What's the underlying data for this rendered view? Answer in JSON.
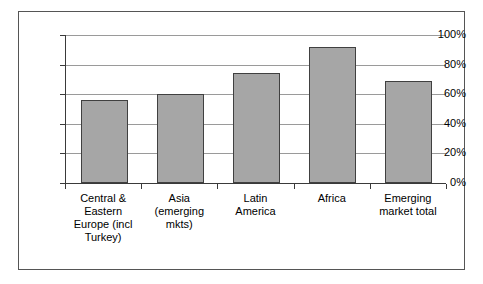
{
  "chart_data": {
    "type": "bar",
    "title": "",
    "subtitle": "",
    "xlabel": "",
    "ylabel": "",
    "categories": [
      "Central & Eastern Europe (incl Turkey)",
      "Asia (emerging mkts)",
      "Latin America",
      "Africa",
      "Emerging market total"
    ],
    "values": [
      56,
      60,
      74,
      92,
      69
    ],
    "value_unit": "%",
    "ylim": [
      0,
      100
    ],
    "ytick_labels": [
      "0%",
      "20%",
      "40%",
      "60%",
      "80%",
      "100%"
    ],
    "ytick_values": [
      0,
      20,
      40,
      60,
      80,
      100
    ],
    "grid": true,
    "grid_axis": "y",
    "legend": false,
    "legend_position": "none",
    "bar_fill_color": "#a6a6a6",
    "bar_border_color": "#404040",
    "gridline_color": "#9a9a9a",
    "axis_color": "#3a3a3a",
    "plot_background": "#ffffff",
    "frame_border_color": "#555555"
  },
  "axis": {
    "y_labels": [
      {
        "text": "100%",
        "value": 100
      },
      {
        "text": "80%",
        "value": 80
      },
      {
        "text": "60%",
        "value": 60
      },
      {
        "text": "40%",
        "value": 40
      },
      {
        "text": "20%",
        "value": 20
      },
      {
        "text": "0%",
        "value": 0
      }
    ]
  },
  "categories_display": [
    {
      "lines": [
        "Central &",
        "Eastern",
        "Europe (incl",
        "Turkey)"
      ]
    },
    {
      "lines": [
        "Asia",
        "(emerging",
        "mkts)"
      ]
    },
    {
      "lines": [
        "Latin",
        "America"
      ]
    },
    {
      "lines": [
        "Africa"
      ]
    },
    {
      "lines": [
        "Emerging",
        "market total"
      ]
    }
  ]
}
